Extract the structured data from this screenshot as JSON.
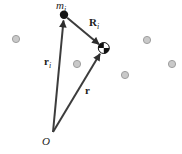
{
  "figure": {
    "background_color": "#ffffff",
    "vector_color": "#3c3c3c",
    "arrowhead_color": "#2e2e2e",
    "mass_dot_color": "#151515",
    "particle_fill": "#c9c9c9",
    "particle_edge": "#9f9f9f",
    "com_symbol_black": "#111111",
    "com_symbol_white": "#ffffff",
    "labels": {
      "mass": {
        "base": "m",
        "sub": "i"
      },
      "R_i": {
        "base": "R",
        "sub": "i"
      },
      "r_i": {
        "base": "r",
        "sub": "i"
      },
      "r": {
        "base": "r"
      },
      "origin": {
        "base": "O"
      }
    }
  }
}
